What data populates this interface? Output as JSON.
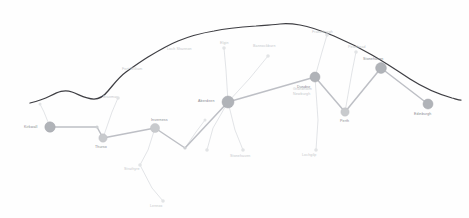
{
  "map": {
    "title": "Network Route Map",
    "background_color": "#fefefe",
    "boundary_color": "#2e2e33",
    "route_color": "#b9bcc2",
    "branch_color": "#d9dcdf",
    "node_color": "#b0b3b8",
    "label_color": "#9a9ea3"
  },
  "boundary": {
    "name": "coastline",
    "path": "M 30 103 C 38 101 44 99 50 96 C 58 92 64 89 72 92 C 80 95 86 99 94 99 C 100 99 104 96 108 91 C 114 84 119 77 126 72 C 133 67 140 62 148 57 C 158 51 168 45 178 41 C 190 36 202 33 214 31 C 228 28 242 27 256 26 C 266 25 274 25 280 24 C 288 23 294 24 300 25 C 312 27 322 31 334 36 C 348 42 360 48 372 55 C 386 63 398 71 410 79 C 424 88 438 94 452 98 C 456 99 459 100 461 100"
  },
  "routes": [
    {
      "name": "main-western-line",
      "points": [
        [
          50,
          127
        ],
        [
          97,
          127
        ],
        [
          103,
          138
        ]
      ]
    },
    {
      "name": "main-central-line",
      "points": [
        [
          103,
          138
        ],
        [
          155,
          128
        ],
        [
          185,
          148
        ],
        [
          228,
          102
        ]
      ]
    },
    {
      "name": "main-eastern-line",
      "points": [
        [
          228,
          102
        ],
        [
          315,
          77
        ],
        [
          345,
          112
        ],
        [
          381,
          68
        ],
        [
          428,
          104
        ]
      ]
    }
  ],
  "branches": [
    {
      "name": "branch-hub-south-west",
      "points": [
        [
          228,
          102
        ],
        [
          213,
          128
        ],
        [
          207,
          150
        ]
      ]
    },
    {
      "name": "branch-hub-south-east",
      "points": [
        [
          228,
          102
        ],
        [
          235,
          130
        ],
        [
          243,
          150
        ]
      ]
    },
    {
      "name": "branch-central-south",
      "points": [
        [
          155,
          128
        ],
        [
          148,
          150
        ],
        [
          140,
          165
        ]
      ]
    },
    {
      "name": "branch-central-far-south",
      "points": [
        [
          140,
          165
        ],
        [
          152,
          188
        ],
        [
          163,
          201
        ]
      ]
    },
    {
      "name": "branch-east-south",
      "points": [
        [
          315,
          77
        ],
        [
          318,
          120
        ],
        [
          316,
          150
        ]
      ]
    },
    {
      "name": "branch-hub-north-west",
      "points": [
        [
          228,
          102
        ],
        [
          226,
          70
        ],
        [
          224,
          48
        ]
      ]
    },
    {
      "name": "branch-hub-north-east",
      "points": [
        [
          228,
          102
        ],
        [
          250,
          78
        ],
        [
          268,
          56
        ]
      ]
    },
    {
      "name": "branch-north-spur",
      "points": [
        [
          315,
          77
        ],
        [
          322,
          52
        ],
        [
          327,
          35
        ]
      ]
    },
    {
      "name": "branch-north-mid",
      "points": [
        [
          345,
          112
        ],
        [
          352,
          72
        ],
        [
          356,
          52
        ]
      ]
    },
    {
      "name": "branch-west-upper",
      "points": [
        [
          103,
          138
        ],
        [
          112,
          112
        ],
        [
          118,
          98
        ]
      ]
    },
    {
      "name": "branch-far-west",
      "points": [
        [
          50,
          127
        ],
        [
          44,
          112
        ],
        [
          40,
          104
        ]
      ]
    },
    {
      "name": "branch-mid-connector",
      "points": [
        [
          185,
          148
        ],
        [
          196,
          132
        ],
        [
          205,
          120
        ]
      ]
    }
  ],
  "nodes": [
    {
      "name": "station-west-terminus",
      "x": 50,
      "y": 127,
      "r": 5.2,
      "size": "major",
      "label": "Kirkwall",
      "label_dx": -26,
      "label_dy": 1.2,
      "anchor": "start"
    },
    {
      "name": "station-west-junction",
      "x": 103,
      "y": 138,
      "r": 4.2,
      "size": "minor",
      "label": "Thurso",
      "label_dx": -8,
      "label_dy": 10,
      "anchor": "start"
    },
    {
      "name": "station-central",
      "x": 155,
      "y": 128,
      "r": 4.6,
      "size": "minor",
      "label": "Inverness",
      "label_dx": -4,
      "label_dy": -7,
      "anchor": "start"
    },
    {
      "name": "station-central-hub",
      "x": 228,
      "y": 102,
      "r": 6.0,
      "size": "major",
      "label": "Aberdeen",
      "label_dx": -30,
      "label_dy": -0.5,
      "anchor": "start"
    },
    {
      "name": "station-east-mid",
      "x": 315,
      "y": 77,
      "r": 5.0,
      "size": "major",
      "label": "Dundee",
      "label_dx": -18,
      "label_dy": 11,
      "anchor": "start"
    },
    {
      "name": "station-south-bend",
      "x": 345,
      "y": 112,
      "r": 4.2,
      "size": "minor",
      "label": "Perth",
      "label_dx": -5,
      "label_dy": 10,
      "anchor": "start"
    },
    {
      "name": "station-north-east",
      "x": 381,
      "y": 68,
      "r": 5.4,
      "size": "major",
      "label": "Stonehaven",
      "label_dx": -18,
      "label_dy": -8,
      "anchor": "start"
    },
    {
      "name": "station-east-terminus",
      "x": 428,
      "y": 104,
      "r": 5.0,
      "size": "major",
      "label": "Edinburgh",
      "label_dx": -14,
      "label_dy": 11,
      "anchor": "start"
    }
  ],
  "minor_markers": [
    {
      "name": "marker-north-inland",
      "x": 224,
      "y": 48,
      "r": 1.8
    },
    {
      "name": "marker-north-coast",
      "x": 268,
      "y": 56,
      "r": 1.8
    },
    {
      "name": "marker-north-spur",
      "x": 327,
      "y": 35,
      "r": 1.8
    },
    {
      "name": "marker-north-mid",
      "x": 356,
      "y": 52,
      "r": 1.8
    },
    {
      "name": "marker-south-west",
      "x": 207,
      "y": 150,
      "r": 1.8
    },
    {
      "name": "marker-south-east",
      "x": 243,
      "y": 150,
      "r": 1.8
    },
    {
      "name": "marker-far-south",
      "x": 163,
      "y": 201,
      "r": 1.8
    },
    {
      "name": "marker-central-south",
      "x": 140,
      "y": 165,
      "r": 1.8
    },
    {
      "name": "marker-east-south",
      "x": 316,
      "y": 150,
      "r": 1.8
    },
    {
      "name": "marker-west-upper",
      "x": 118,
      "y": 98,
      "r": 1.8
    },
    {
      "name": "marker-far-west",
      "x": 40,
      "y": 104,
      "r": 1.5
    },
    {
      "name": "marker-mid-connector",
      "x": 205,
      "y": 120,
      "r": 1.5
    }
  ],
  "vertices": [
    {
      "name": "vertex-west-corner",
      "x": 97,
      "y": 127
    },
    {
      "name": "vertex-valley",
      "x": 185,
      "y": 148
    }
  ],
  "place_labels": [
    {
      "name": "label-loch-area",
      "text": "Loch Shannon",
      "x": 167,
      "y": 50,
      "style": "faint"
    },
    {
      "name": "label-hill-area",
      "text": "Fort William",
      "x": 122,
      "y": 70,
      "style": "faint"
    },
    {
      "name": "label-upper-mid",
      "text": "Elgin",
      "x": 220,
      "y": 44,
      "style": "faint"
    },
    {
      "name": "label-bannockburn",
      "text": "Bannockburn",
      "x": 253,
      "y": 47,
      "style": "faint"
    },
    {
      "name": "label-north-coast",
      "text": "Fraserburgh",
      "x": 312,
      "y": 33,
      "style": "faint"
    },
    {
      "name": "label-peterhead",
      "text": "Peterhead",
      "x": 348,
      "y": 48,
      "style": "faint"
    },
    {
      "name": "label-braemar",
      "text": "Braemar",
      "x": 103,
      "y": 98,
      "style": "faint"
    },
    {
      "name": "label-south-west",
      "text": "Stonehaven",
      "x": 230,
      "y": 157,
      "style": "faint"
    },
    {
      "name": "label-south-east",
      "text": "Lochgilp",
      "x": 302,
      "y": 156,
      "style": "faint"
    },
    {
      "name": "label-central-south",
      "text": "Strathyre",
      "x": 124,
      "y": 170,
      "style": "faint"
    },
    {
      "name": "label-far-south",
      "text": "Lennox",
      "x": 150,
      "y": 207,
      "style": "faint"
    },
    {
      "name": "label-grand-sub",
      "text": "Grandholm",
      "x": 293,
      "y": 90,
      "style": "faint"
    },
    {
      "name": "label-grand-sub2",
      "text": "Newburgh",
      "x": 293,
      "y": 95,
      "style": "faint"
    }
  ]
}
